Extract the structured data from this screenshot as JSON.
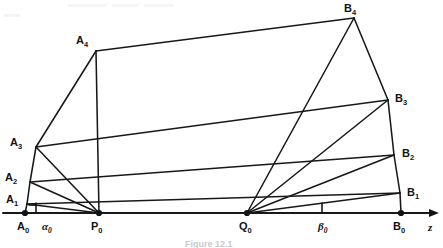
{
  "figure": {
    "caption": "Figure 12.1",
    "background_color": "#ffffff",
    "line_color": "#17181a",
    "axis": {
      "name": "z-axis",
      "label": "z",
      "label_style": "italic",
      "y": 213,
      "x_start": 3,
      "x_end": 441,
      "arrow": "right"
    },
    "angles": [
      {
        "id": "alpha0",
        "label": "α",
        "subscript": "0",
        "at_point": "A0",
        "label_x": 42,
        "label_y": 230,
        "tick_x": 36,
        "tick_top": 203,
        "tick_bottom": 213
      },
      {
        "id": "beta0",
        "label": "β",
        "subscript": "0",
        "at_point": "B0",
        "label_x": 318,
        "label_y": 230,
        "tick_x": 322,
        "tick_top": 203,
        "tick_bottom": 213
      }
    ],
    "points": [
      {
        "id": "A0",
        "letter": "A",
        "subscript": "0",
        "x": 25,
        "y": 213,
        "label_x": 17,
        "label_y": 230,
        "dot": true,
        "on_axis": true
      },
      {
        "id": "A1",
        "letter": "A",
        "subscript": "1",
        "x": 27,
        "y": 204,
        "label_x": 6,
        "label_y": 203,
        "dot": false,
        "on_axis": false
      },
      {
        "id": "A2",
        "letter": "A",
        "subscript": "2",
        "x": 30,
        "y": 182,
        "label_x": 5,
        "label_y": 181,
        "dot": false,
        "on_axis": false
      },
      {
        "id": "A3",
        "letter": "A",
        "subscript": "3",
        "x": 36,
        "y": 147,
        "label_x": 10,
        "label_y": 146,
        "dot": false,
        "on_axis": false
      },
      {
        "id": "A4",
        "letter": "A",
        "subscript": "4",
        "x": 96,
        "y": 51,
        "label_x": 76,
        "label_y": 44,
        "dot": false,
        "on_axis": false
      },
      {
        "id": "P0",
        "letter": "P",
        "subscript": "0",
        "x": 99,
        "y": 213,
        "label_x": 91,
        "label_y": 230,
        "dot": true,
        "on_axis": true
      },
      {
        "id": "Q0",
        "letter": "Q",
        "subscript": "0",
        "x": 247,
        "y": 213,
        "label_x": 239,
        "label_y": 230,
        "dot": true,
        "on_axis": true
      },
      {
        "id": "B0",
        "letter": "B",
        "subscript": "0",
        "x": 401,
        "y": 213,
        "label_x": 393,
        "label_y": 230,
        "dot": true,
        "on_axis": true
      },
      {
        "id": "B1",
        "letter": "B",
        "subscript": "1",
        "x": 400,
        "y": 193,
        "label_x": 407,
        "label_y": 196,
        "dot": false,
        "on_axis": false
      },
      {
        "id": "B2",
        "letter": "B",
        "subscript": "2",
        "x": 394,
        "y": 155,
        "label_x": 402,
        "label_y": 157,
        "dot": false,
        "on_axis": false
      },
      {
        "id": "B3",
        "letter": "B",
        "subscript": "3",
        "x": 388,
        "y": 100,
        "label_x": 395,
        "label_y": 102,
        "dot": false,
        "on_axis": false
      },
      {
        "id": "B4",
        "letter": "B",
        "subscript": "4",
        "x": 354,
        "y": 18,
        "label_x": 344,
        "label_y": 12,
        "dot": false,
        "on_axis": false
      }
    ],
    "edges": [
      {
        "id": "A0-A1",
        "from": "A0",
        "to": "A1",
        "kind": "left-chain"
      },
      {
        "id": "A1-A2",
        "from": "A1",
        "to": "A2",
        "kind": "left-chain"
      },
      {
        "id": "A2-A3",
        "from": "A2",
        "to": "A3",
        "kind": "left-chain"
      },
      {
        "id": "A3-A4",
        "from": "A3",
        "to": "A4",
        "kind": "left-chain"
      },
      {
        "id": "B0-B1",
        "from": "B0",
        "to": "B1",
        "kind": "right-chain"
      },
      {
        "id": "B1-B2",
        "from": "B1",
        "to": "B2",
        "kind": "right-chain"
      },
      {
        "id": "B2-B3",
        "from": "B2",
        "to": "B3",
        "kind": "right-chain"
      },
      {
        "id": "B3-B4",
        "from": "B3",
        "to": "B4",
        "kind": "right-chain"
      },
      {
        "id": "A1-B1",
        "from": "A1",
        "to": "B1",
        "kind": "chord"
      },
      {
        "id": "A2-B2",
        "from": "A2",
        "to": "B2",
        "kind": "chord"
      },
      {
        "id": "A3-B3",
        "from": "A3",
        "to": "B3",
        "kind": "chord"
      },
      {
        "id": "A4-B4",
        "from": "A4",
        "to": "B4",
        "kind": "chord"
      },
      {
        "id": "P0-A1",
        "from": "P0",
        "to": "A1",
        "kind": "p-fan"
      },
      {
        "id": "P0-A2",
        "from": "P0",
        "to": "A2",
        "kind": "p-fan"
      },
      {
        "id": "P0-A3",
        "from": "P0",
        "to": "A3",
        "kind": "p-fan"
      },
      {
        "id": "P0-A4",
        "from": "P0",
        "to": "A4",
        "kind": "p-fan"
      },
      {
        "id": "Q0-B1",
        "from": "Q0",
        "to": "B1",
        "kind": "q-fan"
      },
      {
        "id": "Q0-B2",
        "from": "Q0",
        "to": "B2",
        "kind": "q-fan"
      },
      {
        "id": "Q0-B3",
        "from": "Q0",
        "to": "B3",
        "kind": "q-fan"
      },
      {
        "id": "Q0-B4",
        "from": "Q0",
        "to": "B4",
        "kind": "q-fan"
      }
    ]
  }
}
